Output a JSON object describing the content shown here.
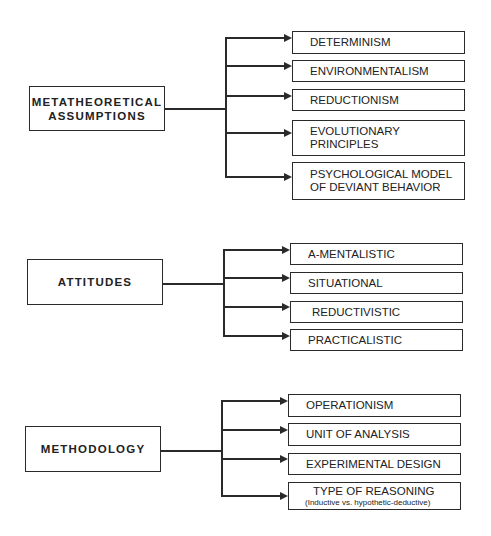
{
  "diagram": {
    "groups": [
      {
        "label_lines": [
          "METATHEORETICAL",
          "ASSUMPTIONS"
        ],
        "items": [
          {
            "lines": [
              "DETERMINISM"
            ]
          },
          {
            "lines": [
              "ENVIRONMENTALISM"
            ]
          },
          {
            "lines": [
              "REDUCTIONISM"
            ]
          },
          {
            "lines": [
              "EVOLUTIONARY",
              "PRINCIPLES"
            ]
          },
          {
            "lines": [
              "PSYCHOLOGICAL MODEL",
              "OF DEVIANT BEHAVIOR"
            ]
          }
        ]
      },
      {
        "label_lines": [
          "ATTITUDES"
        ],
        "items": [
          {
            "lines": [
              "A-MENTALISTIC"
            ]
          },
          {
            "lines": [
              "SITUATIONAL"
            ]
          },
          {
            "lines": [
              "REDUCTIVISTIC"
            ]
          },
          {
            "lines": [
              "PRACTICALISTIC"
            ]
          }
        ]
      },
      {
        "label_lines": [
          "METHODOLOGY"
        ],
        "items": [
          {
            "lines": [
              "OPERATIONISM"
            ]
          },
          {
            "lines": [
              "UNIT OF ANALYSIS"
            ]
          },
          {
            "lines": [
              "EXPERIMENTAL DESIGN"
            ]
          },
          {
            "lines": [
              "TYPE OF REASONING"
            ],
            "sub": "(Inductive vs. hypothetic-deductive)"
          }
        ]
      }
    ]
  }
}
